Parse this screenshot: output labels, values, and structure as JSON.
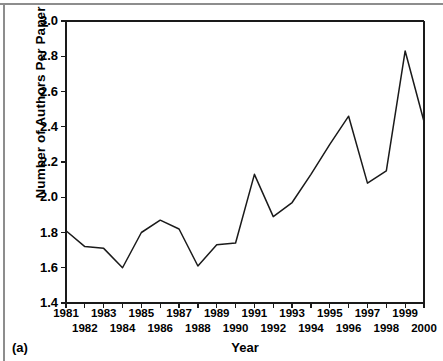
{
  "figure": {
    "panel_caption": "(a)"
  },
  "chart_data": {
    "type": "line",
    "title": "",
    "xlabel": "Year",
    "ylabel": "Number of Authors Per Paper",
    "xlim": [
      1981,
      2000
    ],
    "ylim": [
      1.4,
      3.0
    ],
    "grid": false,
    "legend": null,
    "x": [
      1981,
      1982,
      1983,
      1984,
      1985,
      1986,
      1987,
      1988,
      1989,
      1990,
      1991,
      1992,
      1993,
      1994,
      1995,
      1996,
      1997,
      1998,
      1999,
      2000
    ],
    "values": [
      1.81,
      1.72,
      1.71,
      1.6,
      1.8,
      1.87,
      1.82,
      1.61,
      1.73,
      1.74,
      2.13,
      1.89,
      1.97,
      2.13,
      2.3,
      2.46,
      2.08,
      2.15,
      2.83,
      2.43
    ],
    "ytick_labels": [
      "1.4",
      "1.6",
      "1.8",
      "2.0",
      "2.2",
      "2.4",
      "2.6",
      "2.8",
      "3.0"
    ],
    "ytick_values": [
      1.4,
      1.6,
      1.8,
      2.0,
      2.2,
      2.4,
      2.6,
      2.8,
      3.0
    ],
    "xtick_labels_upper": [
      "1981",
      "1983",
      "1985",
      "1987",
      "1989",
      "1991",
      "1993",
      "1995",
      "1997",
      "1999"
    ],
    "xtick_values_upper": [
      1981,
      1983,
      1985,
      1987,
      1989,
      1991,
      1993,
      1995,
      1997,
      1999
    ],
    "xtick_labels_lower": [
      "1982",
      "1984",
      "1986",
      "1988",
      "1990",
      "1992",
      "1994",
      "1996",
      "1998",
      "2000"
    ],
    "xtick_values_lower": [
      1982,
      1984,
      1986,
      1988,
      1990,
      1992,
      1994,
      1996,
      1998,
      2000
    ],
    "line_color": "#1a1a1a",
    "axis_color": "#1a1a1a",
    "background_color": "#ffffff"
  }
}
